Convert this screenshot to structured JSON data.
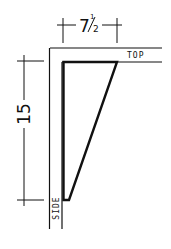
{
  "diagram": {
    "type": "bracket-dimension-drawing",
    "stroke_color": "#111111",
    "background": "#ffffff",
    "dimensions": {
      "width": {
        "label_whole": "7",
        "label_fraction_num": "1",
        "label_fraction_den": "2",
        "label": "7½"
      },
      "height": {
        "label": "15"
      }
    },
    "labels": {
      "top": "TOP",
      "side": "SIDE"
    }
  }
}
